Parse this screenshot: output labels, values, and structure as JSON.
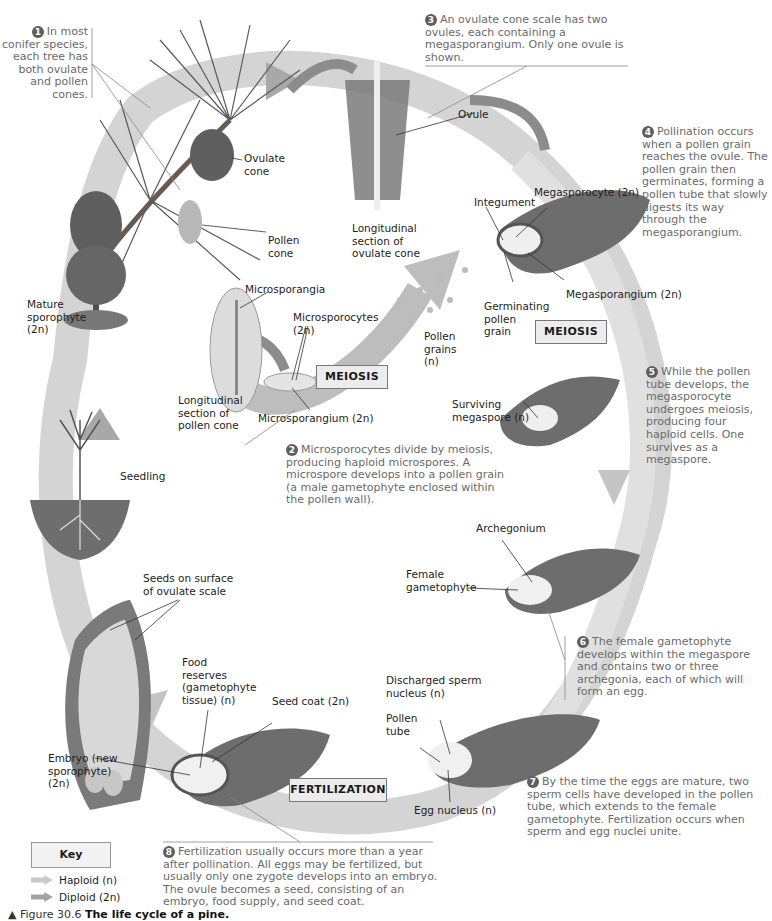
{
  "figure": {
    "caption_prefix": "▲ Figure 30.6",
    "caption_title": "The life cycle of a pine."
  },
  "colors": {
    "haploid_arrow": "#c9c9c9",
    "diploid_arrow": "#a3a3a3",
    "cycle_band": "#cfcfcf",
    "tissue": "#6d6d6d",
    "step_text": "#6a6a6a",
    "box_fill": "#ececec"
  },
  "steps": [
    {
      "num": "1",
      "text": "In most conifer species, each tree has both ovulate and pollen cones."
    },
    {
      "num": "2",
      "text": "Microsporocytes divide by meiosis, producing haploid microspores. A microspore develops into a pollen grain (a male gametophyte enclosed within the pollen wall)."
    },
    {
      "num": "3",
      "text": "An ovulate cone scale has two ovules, each containing a megasporangium. Only one ovule is shown."
    },
    {
      "num": "4",
      "text": "Pollination occurs when a pollen grain reaches the ovule. The pollen grain then germinates, forming a pollen tube that slowly digests its way through the megasporangium."
    },
    {
      "num": "5",
      "text": "While the pollen tube develops, the megasporocyte undergoes meiosis, producing four haploid cells. One survives as a megaspore."
    },
    {
      "num": "6",
      "text": "The female gametophyte develops within the megaspore and contains two or three archegonia, each of which will form an egg."
    },
    {
      "num": "7",
      "text": "By the time the eggs are mature, two sperm cells have developed in the pollen tube, which extends to the female gametophyte. Fertilization occurs when sperm and egg nuclei unite."
    },
    {
      "num": "8",
      "text": "Fertilization usually occurs more than a year after pollination. All eggs may be fertilized, but usually only one zygote develops into an embryo. The ovule becomes a seed, consisting of an embryo, food supply, and seed coat."
    }
  ],
  "labels": {
    "ovulate_cone": "Ovulate cone",
    "pollen_cone": "Pollen cone",
    "mature_sporophyte": "Mature sporophyte",
    "mature_sporophyte_ploidy": "(2n)",
    "long_section_ovulate": "Longitudinal section of ovulate cone",
    "ovule": "Ovule",
    "microsporangia": "Microsporangia",
    "microsporocytes": "Microsporocytes",
    "microsporocytes_ploidy": "(2n)",
    "long_section_pollen": "Longitudinal section of pollen cone",
    "microsporangium": "Microsporangium (2n)",
    "pollen_grains": "Pollen grains (n)",
    "megasporocyte": "Megasporocyte (2n)",
    "integument": "Integument",
    "megasporangium": "Megasporangium (2n)",
    "germinating_pollen_grain": "Germinating pollen grain",
    "surviving_megaspore": "Surviving megaspore (n)",
    "seedling": "Seedling",
    "archegonium": "Archegonium",
    "female_gametophyte": "Female gametophyte",
    "seeds_on_scale": "Seeds on surface of ovulate scale",
    "food_reserves": "Food reserves (gametophyte tissue) (n)",
    "seed_coat": "Seed coat (2n)",
    "discharged_sperm": "Discharged sperm nucleus (n)",
    "pollen_tube": "Pollen tube",
    "embryo": "Embryo (new sporophyte) (2n)",
    "egg_nucleus": "Egg nucleus (n)"
  },
  "process_boxes": {
    "meiosis_1": "MEIOSIS",
    "meiosis_2": "MEIOSIS",
    "fertilization": "FERTILIZATION"
  },
  "key": {
    "title": "Key",
    "items": [
      {
        "label": "Haploid (n)",
        "color": "#c9c9c9"
      },
      {
        "label": "Diploid (2n)",
        "color": "#a3a3a3"
      }
    ]
  }
}
